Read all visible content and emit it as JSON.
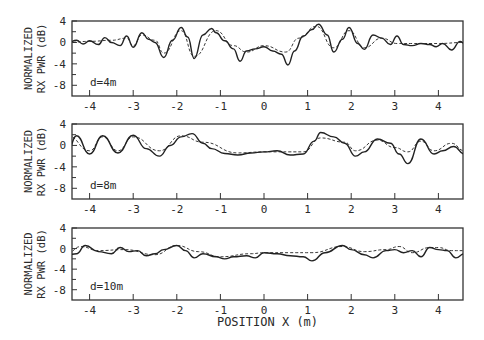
{
  "chart_data": {
    "type": "line",
    "xlabel": "POSITION X (m)",
    "ylabel": "NORMALIZED RX PWR (dB)",
    "xlim": [
      -4.5,
      4.6
    ],
    "x_ticks": [
      -4,
      -3,
      -2,
      -1,
      0,
      1,
      2,
      3,
      4
    ],
    "y_ticks": [
      4,
      0,
      -4,
      -8
    ],
    "ylim": [
      -10,
      4
    ],
    "grid": false,
    "legend": "none (solid = measured, dashed = predicted)",
    "panels": [
      {
        "annotation": "d=4m",
        "series": [
          {
            "name": "solid",
            "style": "solid",
            "x": [
              -4.5,
              -4.3,
              -4.15,
              -4.0,
              -3.8,
              -3.65,
              -3.5,
              -3.3,
              -3.15,
              -3.0,
              -2.8,
              -2.65,
              -2.5,
              -2.3,
              -2.1,
              -1.9,
              -1.75,
              -1.6,
              -1.4,
              -1.2,
              -1.1,
              -0.9,
              -0.7,
              -0.55,
              -0.4,
              -0.2,
              0.0,
              0.2,
              0.4,
              0.55,
              0.7,
              0.9,
              1.1,
              1.25,
              1.45,
              1.6,
              1.8,
              1.95,
              2.15,
              2.3,
              2.5,
              2.7,
              2.9,
              3.05,
              3.2,
              3.4,
              3.6,
              3.8,
              3.95,
              4.1,
              4.3,
              4.5,
              4.6
            ],
            "y": [
              0,
              0.4,
              -0.3,
              0.3,
              -0.4,
              0.9,
              0,
              -0.6,
              1.2,
              -0.9,
              1.8,
              0.6,
              0,
              -2.8,
              0.4,
              2.8,
              1.0,
              -3.0,
              1.4,
              2.6,
              1.8,
              0.3,
              -1.2,
              -3.5,
              -1.6,
              -1.2,
              -0.8,
              -1.6,
              -2.2,
              -4.2,
              -1.6,
              1.2,
              2.4,
              3.4,
              1.4,
              -1.8,
              0.6,
              2.8,
              -0.2,
              -1.3,
              1.4,
              0.8,
              -0.4,
              1.2,
              -0.4,
              -0.6,
              -0.2,
              -0.4,
              -0.8,
              -0.2,
              -1.4,
              0.2,
              -0.2
            ]
          },
          {
            "name": "dashed",
            "style": "dashed",
            "x": [
              -4.5,
              -4.0,
              -3.5,
              -3.15,
              -3.0,
              -2.8,
              -2.5,
              -2.3,
              -1.9,
              -1.6,
              -1.1,
              -0.7,
              -0.4,
              0.0,
              0.5,
              0.8,
              1.2,
              1.6,
              1.95,
              2.3,
              2.7,
              3.05,
              3.4,
              4.0,
              4.6
            ],
            "y": [
              0,
              0.2,
              0.4,
              0.8,
              -0.6,
              1.4,
              0.4,
              -2.0,
              2.2,
              -2.6,
              2.2,
              -0.6,
              -1.8,
              -0.6,
              -1.8,
              0.8,
              3.0,
              -1.0,
              2.2,
              -1.0,
              0.8,
              -0.2,
              -0.2,
              -0.2,
              0
            ]
          }
        ]
      },
      {
        "annotation": "d=8m",
        "series": [
          {
            "name": "solid",
            "style": "solid",
            "x": [
              -4.5,
              -4.3,
              -4.0,
              -3.7,
              -3.35,
              -3.0,
              -2.7,
              -2.4,
              -2.15,
              -1.9,
              -1.65,
              -1.4,
              -1.2,
              -0.9,
              -0.6,
              -0.3,
              0.0,
              0.3,
              0.6,
              0.9,
              1.15,
              1.3,
              1.6,
              1.85,
              2.1,
              2.3,
              2.6,
              2.9,
              3.1,
              3.3,
              3.6,
              3.9,
              4.1,
              4.35,
              4.6
            ],
            "y": [
              -1,
              1.8,
              -1.6,
              1.8,
              -1.4,
              1.9,
              -0.6,
              -2.0,
              0,
              1.6,
              2.2,
              0.4,
              -0.6,
              -1.5,
              -1.8,
              -1.4,
              -1.2,
              -1.0,
              -1.8,
              -1.6,
              0.8,
              2.4,
              1.6,
              0.4,
              -2.0,
              -1.2,
              1.2,
              0.4,
              -1.6,
              -3.4,
              1.2,
              -1.6,
              -1.0,
              -0.2,
              -1.6
            ]
          },
          {
            "name": "dashed",
            "style": "dashed",
            "x": [
              -4.5,
              -4.0,
              -3.7,
              -3.35,
              -3.0,
              -2.4,
              -1.9,
              -1.4,
              -0.6,
              0.0,
              0.9,
              1.3,
              1.85,
              2.1,
              2.6,
              3.0,
              3.3,
              3.6,
              3.9,
              4.3,
              4.6
            ],
            "y": [
              1.8,
              -1.0,
              1.6,
              -1.0,
              1.6,
              -1.0,
              1.8,
              0.6,
              -1.4,
              -1.2,
              -1.2,
              1.4,
              0.6,
              -1.0,
              1.0,
              -0.4,
              -1.2,
              0.8,
              -1.0,
              0.4,
              -1.0
            ]
          }
        ]
      },
      {
        "annotation": "d=10m",
        "series": [
          {
            "name": "solid",
            "style": "solid",
            "x": [
              -4.5,
              -4.3,
              -4.1,
              -3.8,
              -3.5,
              -3.3,
              -3.1,
              -2.9,
              -2.7,
              -2.5,
              -2.3,
              -2.0,
              -1.8,
              -1.6,
              -1.4,
              -1.1,
              -0.9,
              -0.7,
              -0.4,
              -0.2,
              0.0,
              0.3,
              0.6,
              0.9,
              1.1,
              1.4,
              1.8,
              2.0,
              2.3,
              2.5,
              2.8,
              3.0,
              3.2,
              3.4,
              3.6,
              3.8,
              4.0,
              4.2,
              4.4,
              4.6
            ],
            "y": [
              -1.2,
              -1.0,
              0.6,
              -0.6,
              -1.0,
              0.2,
              -0.6,
              -0.4,
              -1.4,
              -1.0,
              -0.2,
              0.6,
              -0.4,
              -1.8,
              -1.0,
              -1.6,
              -2.0,
              -1.6,
              -1.4,
              -1.8,
              -0.8,
              -1.0,
              -1.4,
              -1.6,
              -2.4,
              -0.8,
              0.6,
              -0.2,
              -1.2,
              -1.8,
              -0.4,
              -0.2,
              -0.8,
              -0.4,
              -1.6,
              0.2,
              -0.2,
              -0.4,
              -1.8,
              -1.0
            ]
          },
          {
            "name": "dashed",
            "style": "dashed",
            "x": [
              -4.5,
              -4.2,
              -3.8,
              -3.2,
              -2.5,
              -2.0,
              -1.5,
              -1.0,
              -0.3,
              0.0,
              0.6,
              1.1,
              1.8,
              2.3,
              2.8,
              3.1,
              3.4,
              3.8,
              4.0,
              4.3,
              4.6
            ],
            "y": [
              -0.8,
              0.4,
              -0.4,
              -0.2,
              -1.2,
              0.6,
              -0.6,
              -1.6,
              -1.0,
              -0.8,
              -0.8,
              -0.8,
              0.4,
              -0.6,
              -0.2,
              0.4,
              -0.8,
              0.2,
              0.2,
              -0.4,
              -0.4
            ]
          }
        ]
      }
    ]
  },
  "labels": {
    "ylabel_line1": "NORMALIZED",
    "ylabel_line2": "RX PWR (dB)",
    "xlabel": "POSITION X (m)",
    "panel_annotations": [
      "d=4m",
      "d=8m",
      "d=10m"
    ],
    "y_tick_labels": [
      "4",
      "0",
      "-4",
      "-8"
    ],
    "x_tick_labels": [
      "-4",
      "-3",
      "-2",
      "-1",
      "0",
      "1",
      "2",
      "3",
      "4"
    ]
  }
}
